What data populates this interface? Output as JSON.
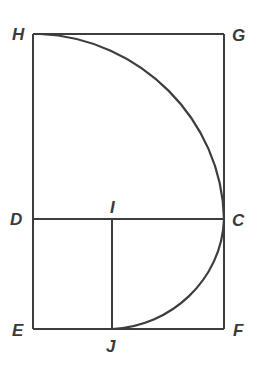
{
  "diagram": {
    "type": "geometric-construction",
    "points": {
      "H": {
        "label": "H",
        "x": 33,
        "y": 34
      },
      "G": {
        "label": "G",
        "x": 224,
        "y": 34
      },
      "D": {
        "label": "D",
        "x": 33,
        "y": 219
      },
      "I": {
        "label": "I",
        "x": 112,
        "y": 219
      },
      "C": {
        "label": "C",
        "x": 224,
        "y": 219
      },
      "E": {
        "label": "E",
        "x": 33,
        "y": 329
      },
      "J": {
        "label": "J",
        "x": 112,
        "y": 329
      },
      "F": {
        "label": "F",
        "x": 224,
        "y": 329
      }
    },
    "segments": [
      "HG",
      "GF",
      "FE",
      "EH",
      "DC",
      "IJ"
    ],
    "arcs": [
      "H-to-C",
      "C-to-J"
    ],
    "colors": {
      "line": "#3d3d3d",
      "label": "#3a3a3a",
      "background": "#ffffff"
    }
  }
}
